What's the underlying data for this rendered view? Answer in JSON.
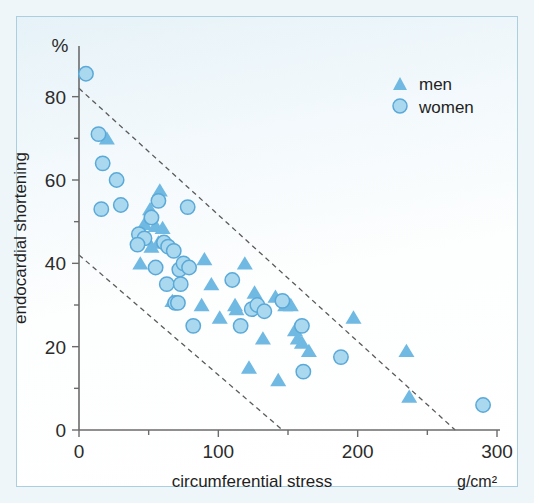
{
  "figure": {
    "background_color": "#eef6fa",
    "plate_color": "#ffffff",
    "border_color": "#a9cfe0"
  },
  "axes": {
    "y_unit": "%",
    "y_title": "endocardial shortening",
    "x_title": "circumferential stress",
    "x_unit": "g/cm²",
    "y_ticks": [
      "0",
      "20",
      "40",
      "60",
      "80"
    ],
    "x_ticks": [
      "0",
      "100",
      "200",
      "300"
    ]
  },
  "legend": {
    "items": [
      {
        "label": "men",
        "marker": "triangle",
        "color": "#6fb9e2"
      },
      {
        "label": "women",
        "marker": "circle",
        "color": "#a9d8ef"
      }
    ]
  },
  "chart_data": {
    "type": "scatter",
    "title": "",
    "xlabel": "circumferential stress",
    "ylabel": "endocardial shortening",
    "x_unit": "g/cm²",
    "y_unit": "%",
    "xlim": [
      0,
      300
    ],
    "ylim": [
      0,
      90
    ],
    "x_ticks": [
      0,
      100,
      200,
      300
    ],
    "y_ticks": [
      0,
      20,
      40,
      60,
      80
    ],
    "grid": false,
    "legend_position": "top-right",
    "series": [
      {
        "name": "men",
        "marker": "triangle",
        "color": "#6fb9e2",
        "points": [
          [
            20,
            70
          ],
          [
            58,
            57.5
          ],
          [
            51,
            53
          ],
          [
            47,
            49.5
          ],
          [
            55,
            49
          ],
          [
            60,
            48.5
          ],
          [
            57,
            45
          ],
          [
            44,
            40
          ],
          [
            52,
            44
          ],
          [
            67,
            31
          ],
          [
            90,
            41
          ],
          [
            88,
            30
          ],
          [
            95,
            35
          ],
          [
            101,
            27
          ],
          [
            112,
            30
          ],
          [
            113,
            29
          ],
          [
            119,
            40
          ],
          [
            122,
            15
          ],
          [
            126,
            33
          ],
          [
            129,
            30
          ],
          [
            132,
            22
          ],
          [
            141,
            32
          ],
          [
            143,
            12
          ],
          [
            148,
            30
          ],
          [
            152,
            30
          ],
          [
            155,
            24
          ],
          [
            157,
            22
          ],
          [
            160,
            21
          ],
          [
            165,
            19
          ],
          [
            197,
            27
          ],
          [
            235,
            19
          ],
          [
            237,
            8
          ]
        ]
      },
      {
        "name": "women",
        "marker": "circle",
        "color": "#a9d8ef",
        "points": [
          [
            5,
            85.5
          ],
          [
            14,
            71
          ],
          [
            17,
            64
          ],
          [
            27,
            60
          ],
          [
            16,
            53
          ],
          [
            30,
            54
          ],
          [
            57,
            55
          ],
          [
            52,
            51
          ],
          [
            78,
            53.5
          ],
          [
            43,
            47
          ],
          [
            47,
            46
          ],
          [
            42,
            44.5
          ],
          [
            61,
            45
          ],
          [
            64,
            44
          ],
          [
            68,
            43
          ],
          [
            55,
            39
          ],
          [
            72,
            38.5
          ],
          [
            75,
            40
          ],
          [
            79,
            39
          ],
          [
            63,
            35
          ],
          [
            73,
            35
          ],
          [
            110,
            36
          ],
          [
            69,
            30.5
          ],
          [
            71,
            30.5
          ],
          [
            82,
            25
          ],
          [
            116,
            25
          ],
          [
            124,
            29
          ],
          [
            128,
            30
          ],
          [
            133,
            28.5
          ],
          [
            146,
            31
          ],
          [
            160,
            25
          ],
          [
            161,
            14
          ],
          [
            188,
            17.5
          ],
          [
            290,
            6
          ]
        ]
      }
    ],
    "reference_lines": [
      {
        "name": "upper-boundary",
        "style": "dashed",
        "from": [
          0,
          82
        ],
        "to": [
          270,
          0
        ]
      },
      {
        "name": "lower-boundary",
        "style": "dashed",
        "from": [
          0,
          42
        ],
        "to": [
          146,
          0
        ]
      }
    ]
  }
}
